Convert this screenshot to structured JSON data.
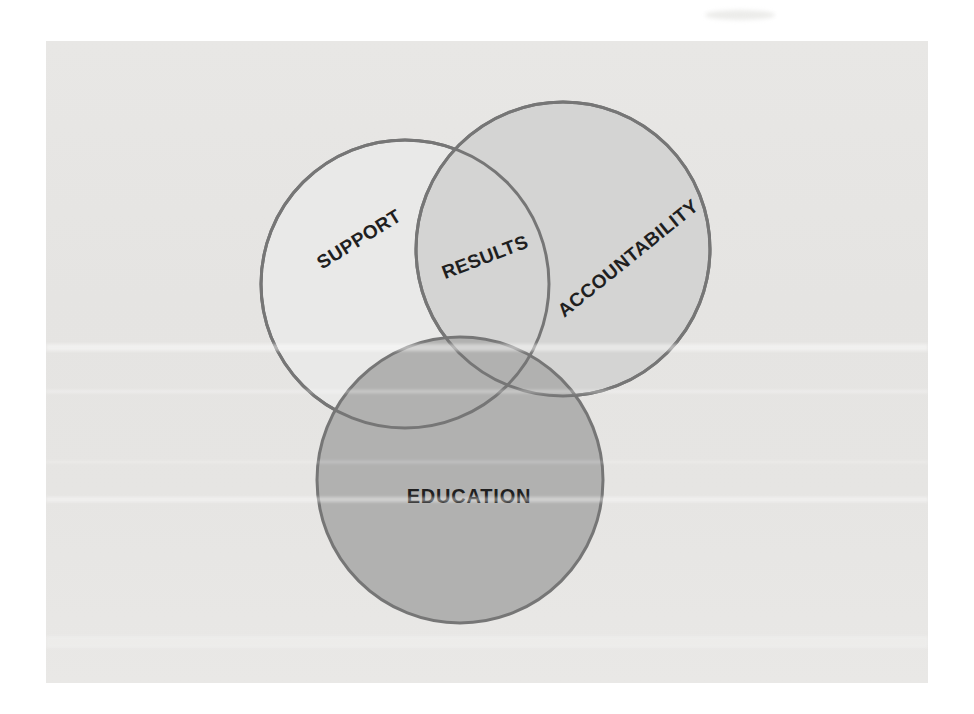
{
  "figure": {
    "type": "venn-diagram",
    "page_color": "#ffffff",
    "background_color": "#e6e5e3",
    "stroke_color": "#767676",
    "stroke_width": 3,
    "text_color": "#1f1f1f",
    "circles": [
      {
        "id": "support",
        "label": "SUPPORT",
        "fill": "#e9e9e8",
        "cx": 359,
        "cy": 243,
        "r": 144,
        "label_x": 313,
        "label_y": 198,
        "label_rotation": -32
      },
      {
        "id": "accountability",
        "label": "ACCOUNTABILITY",
        "fill": "#d4d4d3",
        "cx": 517,
        "cy": 208,
        "r": 147,
        "label_x": 582,
        "label_y": 217,
        "label_rotation": -39
      },
      {
        "id": "education",
        "label": "EDUCATION",
        "fill": "#b1b1b0",
        "cx": 414,
        "cy": 439,
        "r": 143,
        "label_x": 423,
        "label_y": 455,
        "label_rotation": 0
      }
    ],
    "intersection_label": {
      "text": "RESULTS",
      "region": "support-accountability-overlap",
      "x": 439,
      "y": 216,
      "rotation": -21
    }
  }
}
